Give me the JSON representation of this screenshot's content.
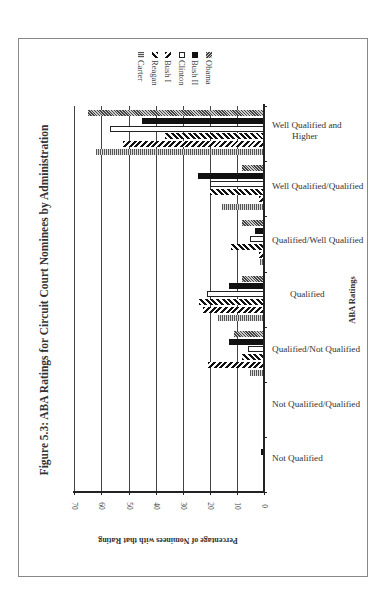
{
  "figure": {
    "title": "Figure 5.3: ABA Ratings for Circuit Court Nominees by Administration",
    "xlabel": "Percentage of Nominees with that Rating",
    "ylabel": "ABA Ratings"
  },
  "legend": [
    {
      "name": "Carter",
      "pattern": "horizontal-stripes"
    },
    {
      "name": "Reagan",
      "pattern": "diagonal-hatch"
    },
    {
      "name": "Bush I",
      "pattern": "zigzag-hatch"
    },
    {
      "name": "Clinton",
      "pattern": "white"
    },
    {
      "name": "Bush II",
      "pattern": "solid-black"
    },
    {
      "name": "Obama",
      "pattern": "dense-diagonal"
    }
  ],
  "axis": {
    "ticks": [
      "0",
      "10",
      "20",
      "30",
      "40",
      "50",
      "60",
      "70"
    ]
  },
  "categories_display": [
    {
      "line1": "Well Qualified and",
      "line2": "Higher"
    },
    {
      "line1": "Well Qualified/Qualified",
      "line2": ""
    },
    {
      "line1": "Qualified/Well Qualified",
      "line2": ""
    },
    {
      "line1": "Qualified",
      "line2": ""
    },
    {
      "line1": "Qualified/Not Qualified",
      "line2": ""
    },
    {
      "line1": "Not Qualified/Qualified",
      "line2": ""
    },
    {
      "line1": "Not Qualified",
      "line2": ""
    }
  ],
  "chart_data": {
    "type": "bar",
    "orientation": "rotated-horizontal",
    "title": "Figure 5.3: ABA Ratings for Circuit Court Nominees by Administration",
    "xlabel": "ABA Ratings",
    "ylabel": "Percentage of Nominees with that Rating",
    "ylim": [
      0,
      70
    ],
    "yticks": [
      0,
      10,
      20,
      30,
      40,
      50,
      60,
      70
    ],
    "grid": true,
    "legend_position": "top-right (rotated)",
    "categories": [
      "Not Qualified",
      "Not Qualified/Qualified",
      "Qualified/Not Qualified",
      "Qualified",
      "Qualified/Well Qualified",
      "Well Qualified/Qualified",
      "Well Qualified and Higher"
    ],
    "series": [
      {
        "name": "Carter",
        "values": [
          0,
          0,
          5,
          17,
          1.5,
          15.5,
          62
        ]
      },
      {
        "name": "Reagan",
        "values": [
          0,
          0,
          20.5,
          22.5,
          2,
          2,
          52
        ]
      },
      {
        "name": "Bush I",
        "values": [
          0,
          0,
          8,
          24,
          12,
          20,
          36.5
        ]
      },
      {
        "name": "Clinton",
        "values": [
          0,
          0,
          6,
          21,
          5,
          20,
          57
        ]
      },
      {
        "name": "Bush II",
        "values": [
          1,
          0,
          13,
          13,
          3.5,
          24.5,
          45
        ]
      },
      {
        "name": "Obama",
        "values": [
          0,
          0,
          11,
          8,
          8,
          8,
          65
        ]
      }
    ]
  }
}
